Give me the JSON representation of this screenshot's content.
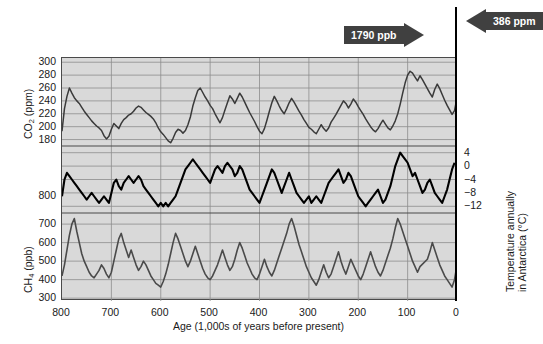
{
  "chart_data": {
    "type": "line",
    "title": "",
    "xlabel": "Age (1,000s of years before present)",
    "xlim": [
      800,
      0
    ],
    "xticks": [
      800,
      700,
      600,
      500,
      400,
      300,
      200,
      100,
      0
    ],
    "grid": true,
    "legend_position": "none",
    "panels": [
      {
        "name": "co2",
        "ylabel": "CO2 (ppm)",
        "ylabel_parts": {
          "pre": "CO",
          "sub": "2",
          "post": " (ppm)"
        },
        "ylim": [
          170,
          305
        ],
        "yticks": [
          300,
          280,
          260,
          240,
          220,
          200,
          180
        ],
        "units": "ppm",
        "color": "#3a3a3a",
        "x": [
          800,
          795,
          790,
          785,
          780,
          775,
          770,
          765,
          760,
          755,
          750,
          745,
          740,
          735,
          730,
          725,
          720,
          715,
          710,
          705,
          700,
          695,
          690,
          685,
          680,
          675,
          670,
          665,
          660,
          655,
          650,
          645,
          640,
          635,
          630,
          625,
          620,
          615,
          610,
          605,
          600,
          595,
          590,
          585,
          580,
          575,
          570,
          565,
          560,
          555,
          550,
          545,
          540,
          535,
          530,
          525,
          520,
          515,
          510,
          505,
          500,
          495,
          490,
          485,
          480,
          475,
          470,
          465,
          460,
          455,
          450,
          445,
          440,
          435,
          430,
          425,
          420,
          415,
          410,
          405,
          400,
          395,
          390,
          385,
          380,
          375,
          370,
          365,
          360,
          355,
          350,
          345,
          340,
          335,
          330,
          325,
          320,
          315,
          310,
          305,
          300,
          295,
          290,
          285,
          280,
          275,
          270,
          265,
          260,
          255,
          250,
          245,
          240,
          235,
          230,
          225,
          220,
          215,
          210,
          205,
          200,
          195,
          190,
          185,
          180,
          175,
          170,
          165,
          160,
          155,
          150,
          145,
          140,
          135,
          130,
          125,
          120,
          115,
          110,
          105,
          100,
          95,
          90,
          85,
          80,
          75,
          70,
          65,
          60,
          55,
          50,
          45,
          40,
          35,
          30,
          25,
          20,
          15,
          10,
          5,
          0
        ],
        "y": [
          193,
          228,
          247,
          260,
          252,
          245,
          240,
          236,
          230,
          224,
          219,
          214,
          209,
          205,
          201,
          198,
          194,
          186,
          181,
          185,
          196,
          205,
          201,
          197,
          205,
          211,
          214,
          218,
          220,
          224,
          229,
          232,
          230,
          226,
          222,
          219,
          216,
          212,
          206,
          198,
          192,
          188,
          183,
          178,
          175,
          182,
          191,
          196,
          194,
          190,
          194,
          203,
          215,
          232,
          245,
          256,
          260,
          253,
          246,
          240,
          233,
          228,
          220,
          213,
          206,
          214,
          226,
          237,
          248,
          243,
          236,
          244,
          252,
          246,
          238,
          230,
          222,
          215,
          208,
          200,
          193,
          189,
          197,
          210,
          224,
          237,
          247,
          240,
          232,
          225,
          220,
          228,
          237,
          244,
          238,
          231,
          224,
          218,
          211,
          205,
          199,
          196,
          192,
          189,
          196,
          203,
          197,
          193,
          198,
          207,
          213,
          219,
          226,
          233,
          240,
          236,
          229,
          235,
          243,
          238,
          231,
          225,
          219,
          212,
          206,
          200,
          195,
          192,
          197,
          204,
          210,
          204,
          198,
          195,
          201,
          209,
          220,
          235,
          252,
          268,
          280,
          286,
          283,
          277,
          271,
          279,
          273,
          266,
          259,
          252,
          246,
          258,
          266,
          259,
          250,
          241,
          233,
          226,
          219,
          225,
          245,
          268,
          282
        ]
      },
      {
        "name": "temperature",
        "ylabel": "Temperature annually in Antarctica (°C)",
        "ylabel_line1": "Temperature annually",
        "ylabel_line2": "in Antarctica (°C)",
        "ylim": [
          -14,
          6
        ],
        "yticks": [
          4,
          0,
          -4,
          -8,
          -12
        ],
        "units": "°C",
        "color": "#000000",
        "x": [
          800,
          795,
          790,
          785,
          780,
          775,
          770,
          765,
          760,
          755,
          750,
          745,
          740,
          735,
          730,
          725,
          720,
          715,
          710,
          705,
          700,
          695,
          690,
          685,
          680,
          675,
          670,
          665,
          660,
          655,
          650,
          645,
          640,
          635,
          630,
          625,
          620,
          615,
          610,
          605,
          600,
          595,
          590,
          585,
          580,
          575,
          570,
          565,
          560,
          555,
          550,
          545,
          540,
          535,
          530,
          525,
          520,
          515,
          510,
          505,
          500,
          495,
          490,
          485,
          480,
          475,
          470,
          465,
          460,
          455,
          450,
          445,
          440,
          435,
          430,
          425,
          420,
          415,
          410,
          405,
          400,
          395,
          390,
          385,
          380,
          375,
          370,
          365,
          360,
          355,
          350,
          345,
          340,
          335,
          330,
          325,
          320,
          315,
          310,
          305,
          300,
          295,
          290,
          285,
          280,
          275,
          270,
          265,
          260,
          255,
          250,
          245,
          240,
          235,
          230,
          225,
          220,
          215,
          210,
          205,
          200,
          195,
          190,
          185,
          180,
          175,
          170,
          165,
          160,
          155,
          150,
          145,
          140,
          135,
          130,
          125,
          120,
          115,
          110,
          105,
          100,
          95,
          90,
          85,
          80,
          75,
          70,
          65,
          60,
          55,
          50,
          45,
          40,
          35,
          30,
          25,
          20,
          15,
          10,
          5,
          0
        ],
        "y": [
          -9,
          -4,
          -2,
          -3,
          -4,
          -5,
          -6,
          -7,
          -8,
          -9,
          -10,
          -9,
          -8,
          -9,
          -10,
          -11,
          -10,
          -9,
          -10,
          -11,
          -8,
          -5,
          -4,
          -6,
          -7,
          -5,
          -4,
          -3,
          -4,
          -5,
          -4,
          -3,
          -4,
          -6,
          -7,
          -8,
          -9,
          -10,
          -11,
          -12,
          -11,
          -12,
          -11,
          -12,
          -11,
          -10,
          -9,
          -7,
          -5,
          -3,
          -1,
          0,
          1,
          2,
          1,
          0,
          -1,
          -2,
          -3,
          -4,
          -5,
          -3,
          -1,
          0,
          -1,
          -2,
          0,
          1,
          0,
          -1,
          -3,
          -2,
          0,
          -1,
          -3,
          -5,
          -7,
          -8,
          -9,
          -10,
          -11,
          -9,
          -7,
          -5,
          -3,
          -1,
          -2,
          -4,
          -6,
          -8,
          -6,
          -4,
          -2,
          -4,
          -6,
          -8,
          -9,
          -10,
          -11,
          -10,
          -9,
          -11,
          -10,
          -9,
          -10,
          -11,
          -9,
          -7,
          -5,
          -4,
          -3,
          -2,
          -1,
          -3,
          -5,
          -4,
          -2,
          -3,
          -5,
          -7,
          -9,
          -10,
          -11,
          -12,
          -11,
          -10,
          -9,
          -8,
          -7,
          -9,
          -11,
          -10,
          -8,
          -6,
          -3,
          0,
          2,
          4,
          3,
          2,
          1,
          -1,
          -3,
          -2,
          -4,
          -6,
          -8,
          -7,
          -5,
          -4,
          -6,
          -8,
          -9,
          -10,
          -11,
          -9,
          -7,
          -4,
          -1,
          1
        ]
      },
      {
        "name": "ch4",
        "ylabel": "CH4 (ppb)",
        "ylabel_parts": {
          "pre": "CH",
          "sub": "4",
          "post": " (ppb)"
        },
        "ylim": [
          290,
          760
        ],
        "yticks": [
          700,
          600,
          500,
          400,
          300
        ],
        "units": "ppb",
        "color": "#4a4a4a",
        "x": [
          800,
          795,
          790,
          785,
          780,
          775,
          770,
          765,
          760,
          755,
          750,
          745,
          740,
          735,
          730,
          725,
          720,
          715,
          710,
          705,
          700,
          695,
          690,
          685,
          680,
          675,
          670,
          665,
          660,
          655,
          650,
          645,
          640,
          635,
          630,
          625,
          620,
          615,
          610,
          605,
          600,
          595,
          590,
          585,
          580,
          575,
          570,
          565,
          560,
          555,
          550,
          545,
          540,
          535,
          530,
          525,
          520,
          515,
          510,
          505,
          500,
          495,
          490,
          485,
          480,
          475,
          470,
          465,
          460,
          455,
          450,
          445,
          440,
          435,
          430,
          425,
          420,
          415,
          410,
          405,
          400,
          395,
          390,
          385,
          380,
          375,
          370,
          365,
          360,
          355,
          350,
          345,
          340,
          335,
          330,
          325,
          320,
          315,
          310,
          305,
          300,
          295,
          290,
          285,
          280,
          275,
          270,
          265,
          260,
          255,
          250,
          245,
          240,
          235,
          230,
          225,
          220,
          215,
          210,
          205,
          200,
          195,
          190,
          185,
          180,
          175,
          170,
          165,
          160,
          155,
          150,
          145,
          140,
          135,
          130,
          125,
          120,
          115,
          110,
          105,
          100,
          95,
          90,
          85,
          80,
          75,
          60,
          55,
          50,
          45,
          40,
          35,
          30,
          25,
          20,
          15,
          10,
          5,
          0
        ],
        "y": [
          420,
          480,
          560,
          640,
          700,
          730,
          660,
          600,
          540,
          500,
          470,
          440,
          420,
          410,
          430,
          450,
          480,
          460,
          430,
          410,
          440,
          500,
          560,
          620,
          650,
          600,
          560,
          520,
          560,
          520,
          480,
          450,
          470,
          500,
          480,
          450,
          420,
          400,
          380,
          370,
          360,
          390,
          430,
          480,
          540,
          600,
          650,
          620,
          580,
          540,
          500,
          470,
          500,
          540,
          580,
          540,
          500,
          460,
          430,
          410,
          400,
          420,
          450,
          480,
          520,
          560,
          520,
          480,
          450,
          470,
          510,
          560,
          600,
          570,
          530,
          490,
          460,
          430,
          410,
          400,
          430,
          470,
          510,
          470,
          440,
          420,
          450,
          490,
          530,
          570,
          610,
          650,
          700,
          730,
          690,
          640,
          590,
          550,
          510,
          470,
          440,
          410,
          390,
          370,
          400,
          440,
          480,
          440,
          410,
          430,
          470,
          510,
          550,
          500,
          460,
          430,
          470,
          510,
          480,
          450,
          420,
          400,
          430,
          470,
          510,
          550,
          510,
          470,
          440,
          420,
          450,
          490,
          530,
          570,
          620,
          680,
          730,
          700,
          660,
          620,
          580,
          540,
          500,
          470,
          440,
          470,
          510,
          550,
          600,
          560,
          520,
          480,
          450,
          420,
          400,
          380,
          360,
          400,
          480,
          620,
          700
        ]
      }
    ],
    "annotations": [
      {
        "name": "ch4-present",
        "label": "1790 ppb",
        "direction": "right",
        "value": 1790,
        "units": "ppb"
      },
      {
        "name": "co2-present",
        "label": "386 ppm",
        "direction": "left",
        "value": 386,
        "units": "ppm"
      }
    ]
  }
}
